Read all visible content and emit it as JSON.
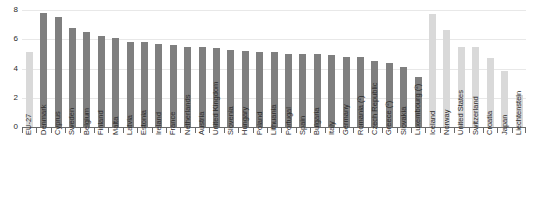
{
  "chart_data": {
    "type": "bar",
    "title": "",
    "subtitle": "",
    "xlabel": "",
    "ylabel": "",
    "ylim": [
      0,
      8
    ],
    "y_ticks": [
      0,
      2,
      4,
      6,
      8
    ],
    "grid": true,
    "legend": "none",
    "categories": [
      "EU-27",
      "Denmark",
      "Cyprus",
      "Sweden",
      "Belgium",
      "Finland",
      "Malta",
      "Latvia",
      "Estonia",
      "Ireland",
      "France",
      "Netherlands",
      "Austria",
      "United Kingdom",
      "Slovenia",
      "Hungary",
      "Poland",
      "Lithuania",
      "Portugal",
      "Spain",
      "Bulgaria",
      "Italy",
      "Germany",
      "Romania (²)",
      "Czech Republic",
      "Greece (²)",
      "Slovakia",
      "Luxembourg (²)",
      "Iceland",
      "Norway",
      "United States",
      "Switzerland",
      "Croatia",
      "Japan",
      "Liechtenstein"
    ],
    "values": [
      5.1,
      7.8,
      7.5,
      6.8,
      6.5,
      6.2,
      6.1,
      5.8,
      5.8,
      5.7,
      5.6,
      5.5,
      5.5,
      5.4,
      5.3,
      5.2,
      5.1,
      5.1,
      5.0,
      5.0,
      5.0,
      4.9,
      4.8,
      4.8,
      4.5,
      4.4,
      4.1,
      3.4,
      7.7,
      6.6,
      5.5,
      5.5,
      4.7,
      3.8,
      2.2
    ],
    "series_styles": [
      "light",
      "dark",
      "dark",
      "dark",
      "dark",
      "dark",
      "dark",
      "dark",
      "dark",
      "dark",
      "dark",
      "dark",
      "dark",
      "dark",
      "dark",
      "dark",
      "dark",
      "dark",
      "dark",
      "dark",
      "dark",
      "dark",
      "dark",
      "dark",
      "dark",
      "dark",
      "dark",
      "dark",
      "light",
      "light",
      "light",
      "light",
      "light",
      "light",
      "light"
    ],
    "colors": {
      "bar_dark": "#7f7f7f",
      "bar_light": "#d9d9d9",
      "grid": "#e8e8e8",
      "axis": "#6b6b6b",
      "text": "#2b2b2b",
      "background": "#ffffff"
    }
  }
}
